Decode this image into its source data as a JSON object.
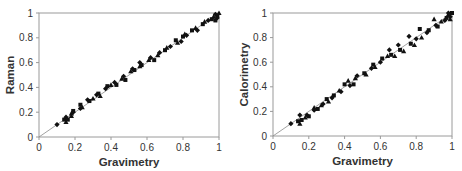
{
  "chart_data": [
    {
      "type": "scatter",
      "title": "",
      "xlabel": "Gravimetry",
      "ylabel": "Raman",
      "xlim": [
        0,
        1
      ],
      "ylim": [
        0,
        1
      ],
      "xticks": [
        "0",
        "0.2",
        "0.4",
        "0.6",
        "0.8",
        "1"
      ],
      "yticks": [
        "0",
        "0.2",
        "0.4",
        "0.6",
        "0.8",
        "1"
      ],
      "grid": false,
      "reference_line": "y = x",
      "box": {
        "left": 39,
        "top": 13,
        "right": 219,
        "bottom": 137
      },
      "series": [
        {
          "name": "data",
          "marker": "mixed (diamond/square/triangle)",
          "color": "#111111",
          "points": [
            [
              0.1,
              0.1
            ],
            [
              0.14,
              0.14
            ],
            [
              0.15,
              0.12
            ],
            [
              0.15,
              0.16
            ],
            [
              0.16,
              0.14
            ],
            [
              0.18,
              0.17
            ],
            [
              0.19,
              0.2
            ],
            [
              0.19,
              0.21
            ],
            [
              0.18,
              0.19
            ],
            [
              0.23,
              0.23
            ],
            [
              0.23,
              0.26
            ],
            [
              0.24,
              0.24
            ],
            [
              0.27,
              0.3
            ],
            [
              0.28,
              0.29
            ],
            [
              0.3,
              0.31
            ],
            [
              0.32,
              0.34
            ],
            [
              0.33,
              0.35
            ],
            [
              0.34,
              0.33
            ],
            [
              0.37,
              0.39
            ],
            [
              0.38,
              0.41
            ],
            [
              0.4,
              0.42
            ],
            [
              0.42,
              0.44
            ],
            [
              0.43,
              0.42
            ],
            [
              0.46,
              0.47
            ],
            [
              0.47,
              0.49
            ],
            [
              0.48,
              0.46
            ],
            [
              0.51,
              0.53
            ],
            [
              0.52,
              0.55
            ],
            [
              0.53,
              0.54
            ],
            [
              0.56,
              0.57
            ],
            [
              0.56,
              0.6
            ],
            [
              0.57,
              0.58
            ],
            [
              0.61,
              0.62
            ],
            [
              0.62,
              0.64
            ],
            [
              0.64,
              0.62
            ],
            [
              0.66,
              0.66
            ],
            [
              0.67,
              0.68
            ],
            [
              0.7,
              0.7
            ],
            [
              0.71,
              0.72
            ],
            [
              0.73,
              0.73
            ],
            [
              0.76,
              0.78
            ],
            [
              0.77,
              0.76
            ],
            [
              0.79,
              0.77
            ],
            [
              0.8,
              0.81
            ],
            [
              0.81,
              0.83
            ],
            [
              0.82,
              0.82
            ],
            [
              0.85,
              0.86
            ],
            [
              0.87,
              0.88
            ],
            [
              0.88,
              0.86
            ],
            [
              0.91,
              0.91
            ],
            [
              0.92,
              0.93
            ],
            [
              0.94,
              0.94
            ],
            [
              0.96,
              0.95
            ],
            [
              0.97,
              0.97
            ],
            [
              0.98,
              0.99
            ],
            [
              0.99,
              0.98
            ],
            [
              1.0,
              1.0
            ],
            [
              0.99,
              0.96
            ],
            [
              0.98,
              0.94
            ]
          ]
        }
      ]
    },
    {
      "type": "scatter",
      "title": "",
      "xlabel": "Gravimetry",
      "ylabel": "Calorimetry",
      "xlim": [
        0,
        1
      ],
      "ylim": [
        0,
        1
      ],
      "xticks": [
        "0",
        "0.2",
        "0.4",
        "0.6",
        "0.8",
        "1"
      ],
      "yticks": [
        "0",
        "0.2",
        "0.4",
        "0.6",
        "0.8",
        "1"
      ],
      "grid": false,
      "reference_line": "y = x",
      "box": {
        "left": 273,
        "top": 13,
        "right": 452,
        "bottom": 136
      },
      "series": [
        {
          "name": "data",
          "marker": "mixed (diamond/square/triangle)",
          "color": "#111111",
          "points": [
            [
              0.1,
              0.1
            ],
            [
              0.14,
              0.12
            ],
            [
              0.15,
              0.1
            ],
            [
              0.15,
              0.17
            ],
            [
              0.16,
              0.13
            ],
            [
              0.18,
              0.15
            ],
            [
              0.19,
              0.17
            ],
            [
              0.2,
              0.16
            ],
            [
              0.23,
              0.23
            ],
            [
              0.23,
              0.21
            ],
            [
              0.25,
              0.22
            ],
            [
              0.27,
              0.25
            ],
            [
              0.28,
              0.26
            ],
            [
              0.3,
              0.3
            ],
            [
              0.31,
              0.28
            ],
            [
              0.33,
              0.31
            ],
            [
              0.34,
              0.33
            ],
            [
              0.37,
              0.37
            ],
            [
              0.38,
              0.36
            ],
            [
              0.4,
              0.42
            ],
            [
              0.42,
              0.45
            ],
            [
              0.43,
              0.41
            ],
            [
              0.45,
              0.42
            ],
            [
              0.46,
              0.47
            ],
            [
              0.47,
              0.49
            ],
            [
              0.51,
              0.51
            ],
            [
              0.52,
              0.5
            ],
            [
              0.55,
              0.55
            ],
            [
              0.56,
              0.58
            ],
            [
              0.57,
              0.56
            ],
            [
              0.6,
              0.6
            ],
            [
              0.61,
              0.63
            ],
            [
              0.64,
              0.65
            ],
            [
              0.65,
              0.7
            ],
            [
              0.66,
              0.66
            ],
            [
              0.68,
              0.65
            ],
            [
              0.7,
              0.74
            ],
            [
              0.71,
              0.7
            ],
            [
              0.73,
              0.69
            ],
            [
              0.76,
              0.81
            ],
            [
              0.77,
              0.75
            ],
            [
              0.79,
              0.74
            ],
            [
              0.8,
              0.79
            ],
            [
              0.82,
              0.87
            ],
            [
              0.83,
              0.8
            ],
            [
              0.86,
              0.84
            ],
            [
              0.87,
              0.86
            ],
            [
              0.9,
              0.95
            ],
            [
              0.91,
              0.9
            ],
            [
              0.92,
              0.89
            ],
            [
              0.94,
              0.93
            ],
            [
              0.96,
              0.94
            ],
            [
              0.97,
              0.96
            ],
            [
              0.98,
              0.99
            ],
            [
              0.99,
              0.97
            ],
            [
              1.0,
              1.0
            ],
            [
              0.99,
              0.95
            ],
            [
              0.98,
              1.0
            ]
          ]
        }
      ]
    }
  ]
}
